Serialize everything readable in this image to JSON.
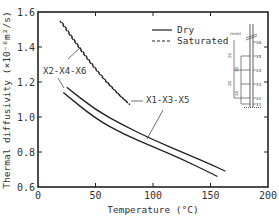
{
  "chart_data": {
    "type": "line",
    "title": "",
    "xlabel": "Temperature (°C)",
    "ylabel": "Thermal diffusivity (×10⁻⁶m²/s)",
    "xlim": [
      0,
      200
    ],
    "ylim": [
      0.6,
      1.6
    ],
    "xticks": [
      "0",
      "50",
      "100",
      "150",
      "200"
    ],
    "yticks": [
      "0.6",
      "0.8",
      "1.0",
      "1.2",
      "1.4",
      "1.6"
    ],
    "grid": false,
    "legend": {
      "position": "upper right",
      "entries": [
        {
          "label": "Dry",
          "style": "solid"
        },
        {
          "label": "Saturated",
          "style": "dashed"
        }
      ]
    },
    "series": [
      {
        "name": "Dry X1-X3-X5",
        "style": "solid",
        "x": [
          25,
          50,
          75,
          100,
          125,
          150,
          163
        ],
        "y": [
          1.17,
          1.04,
          0.95,
          0.87,
          0.8,
          0.73,
          0.69
        ]
      },
      {
        "name": "Dry X2-X4-X6",
        "style": "solid",
        "x": [
          22,
          50,
          75,
          100,
          125,
          150,
          156
        ],
        "y": [
          1.14,
          0.99,
          0.9,
          0.83,
          0.76,
          0.68,
          0.66
        ]
      },
      {
        "name": "Saturated X1-X3-X5",
        "style": "dashed",
        "x": [
          19,
          35,
          50,
          65,
          78
        ],
        "y": [
          1.55,
          1.4,
          1.27,
          1.16,
          1.08
        ]
      },
      {
        "name": "Saturated X2-X4-X6",
        "style": "dashed",
        "x": [
          21,
          37,
          52,
          67,
          80
        ],
        "y": [
          1.54,
          1.39,
          1.26,
          1.15,
          1.07
        ]
      }
    ],
    "annotations": [
      {
        "text": "X2-X4-X6",
        "x": 10,
        "y": 1.27
      },
      {
        "text": "X1-X3-X5",
        "x": 100,
        "y": 1.05
      }
    ],
    "inset": {
      "unit": "(mm)",
      "positions": [
        "X6",
        "X5",
        "X4",
        "X3",
        "X2",
        "X1"
      ],
      "spacings": [
        "20",
        "20",
        "20",
        "20"
      ]
    }
  }
}
